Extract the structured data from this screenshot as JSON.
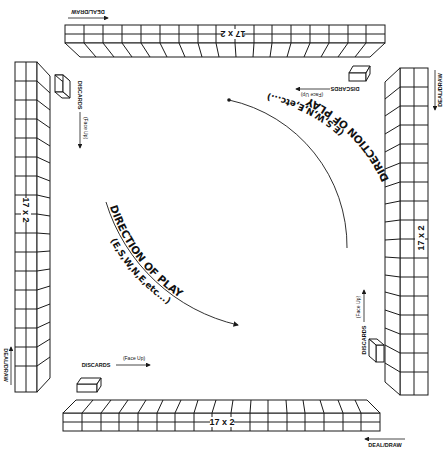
{
  "diagram": {
    "type": "mahjong-table-layout",
    "colors": {
      "line": "#1a1a1a",
      "background": "#ffffff"
    },
    "walls": {
      "top": {
        "label": "17 x 2",
        "deal_label": "DEAL/DRAW",
        "discards_label": "DISCARDS",
        "face_up_label": "(Face Up)"
      },
      "left": {
        "label": "17 x 2",
        "deal_label": "DEAL/DRAW",
        "discards_label": "DISCARDS",
        "face_up_label": "(Face Up)"
      },
      "right": {
        "label": "17 x 2",
        "deal_label": "DEAL/DRAW",
        "discards_label": "DISCARDS",
        "face_up_label": "(Face Up)"
      },
      "bottom": {
        "label": "17 x 2",
        "deal_label": "DEAL/DRAW",
        "discards_label": "DISCARDS",
        "face_up_label": "(Face Up)"
      }
    },
    "direction_upper": {
      "title": "DIRECTION OF PLAY",
      "subtitle": "(E,S,W,N,E,etc...)"
    },
    "direction_lower": {
      "title": "DIRECTION OF PLAY",
      "subtitle": "(E,S,W,N,E,etc...)"
    }
  }
}
